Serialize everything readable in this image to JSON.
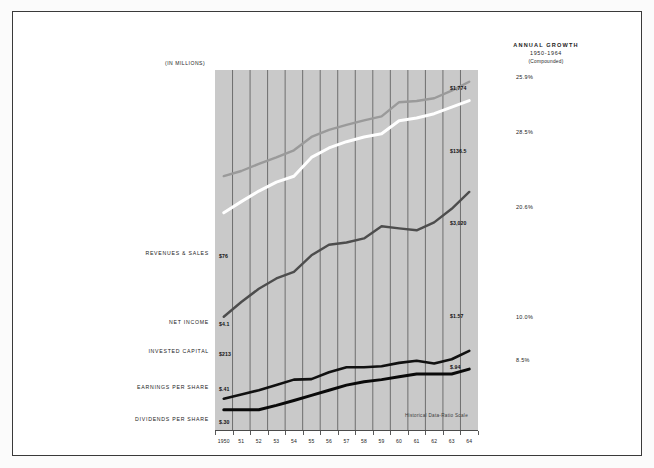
{
  "units_caption": "(IN MILLIONS)",
  "growth_header": {
    "title": "ANNUAL GROWTH",
    "period": "1950-1964",
    "note": "(Compounded)"
  },
  "scale_note": "Historical Data-Ratio Scale",
  "chart_data": {
    "type": "line",
    "title": "",
    "xlabel": "",
    "ylabel": "(IN MILLIONS)",
    "scale": "ratio (logarithmic)",
    "grid": "vertical gridlines only",
    "legend": "inline left labels",
    "x": [
      "1950",
      "51",
      "52",
      "53",
      "54",
      "55",
      "56",
      "57",
      "58",
      "59",
      "60",
      "61",
      "62",
      "63",
      "64"
    ],
    "series": [
      {
        "name": "REVENUES & SALES",
        "color": "#ffffff",
        "start_label": "$76",
        "end_label": "$1,774",
        "growth": "25.9%",
        "values": [
          76,
          104,
          140,
          180,
          212,
          360,
          470,
          560,
          640,
          700,
          1010,
          1090,
          1230,
          1480,
          1774
        ]
      },
      {
        "name": "INVESTED CAPITAL",
        "color": "#9a9a9a",
        "start_label": "$213",
        "end_label": "$3,020",
        "growth": "20.6%",
        "values": [
          213,
          246,
          300,
          360,
          440,
          640,
          780,
          900,
          1020,
          1140,
          1700,
          1760,
          1900,
          2350,
          3020
        ]
      },
      {
        "name": "NET INCOME",
        "color": "#4d4d4d",
        "start_label": "$4.1",
        "end_label": "$136.5",
        "growth": "28.5%",
        "values": [
          4.1,
          6.2,
          9.0,
          12.0,
          14.5,
          23.0,
          31.0,
          33.0,
          37.0,
          52.0,
          49.0,
          46.5,
          58.0,
          85.0,
          136.5
        ]
      },
      {
        "name": "EARNINGS PER SHARE",
        "color": "#111111",
        "start_label": "$.41",
        "end_label": "$1.57",
        "growth": "10.0%",
        "values": [
          0.41,
          0.46,
          0.52,
          0.6,
          0.7,
          0.71,
          0.86,
          0.99,
          0.99,
          1.02,
          1.12,
          1.19,
          1.1,
          1.24,
          1.57
        ]
      },
      {
        "name": "DIVIDENDS PER SHARE",
        "color": "#0a0a0a",
        "start_label": "$.30",
        "end_label": "$.94",
        "growth": "8.5%",
        "values": [
          0.3,
          0.3,
          0.3,
          0.34,
          0.39,
          0.45,
          0.52,
          0.6,
          0.66,
          0.7,
          0.76,
          0.82,
          0.82,
          0.82,
          0.94
        ]
      }
    ],
    "growth_values": [
      "25.9%",
      "28.5%",
      "20.6%",
      "10.0%",
      "8.5%"
    ]
  }
}
